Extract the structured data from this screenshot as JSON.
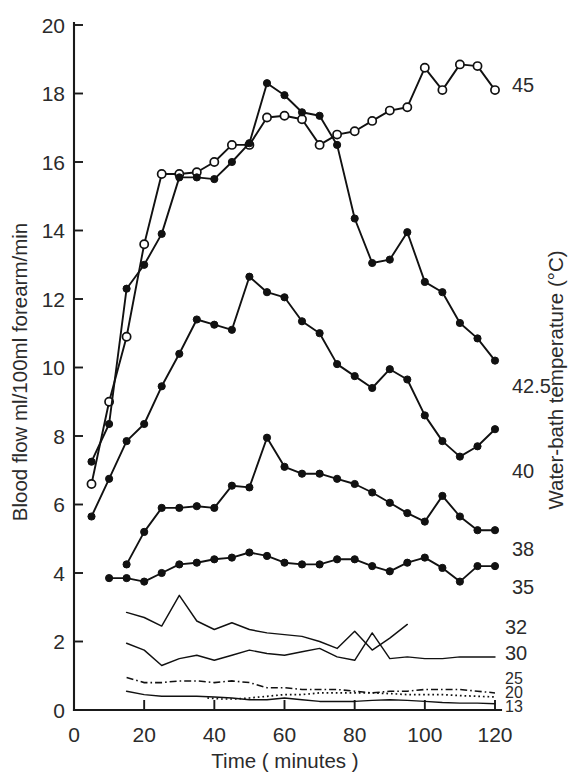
{
  "figure": {
    "kind": "scientific-line-chart",
    "background": "#ffffff",
    "ink_color": "#111111"
  },
  "chart_data": {
    "type": "line",
    "title": "",
    "xlabel": "Time ( minutes )",
    "ylabel": "Blood flow ml/100ml forearm/min",
    "y2label": "Water-bath temperature (°C)",
    "xlim": [
      0,
      123
    ],
    "ylim": [
      0,
      20
    ],
    "xticks": [
      0,
      20,
      40,
      60,
      80,
      100,
      120
    ],
    "xticklabels": [
      "0",
      "20",
      "40",
      "60",
      "80",
      "100",
      "120"
    ],
    "yticks": [
      0,
      2,
      4,
      6,
      8,
      10,
      12,
      14,
      16,
      18,
      20
    ],
    "yticklabels": [
      "0",
      "2",
      "4",
      "6",
      "8",
      "10",
      "12",
      "14",
      "16",
      "18",
      "20"
    ],
    "grid": false,
    "legend_position": "right-of-axes-inline-labels",
    "series": [
      {
        "name": "45",
        "label": "45",
        "marker": "open-circle",
        "linestyle": "solid",
        "x": [
          5,
          10,
          15,
          20,
          25,
          30,
          35,
          40,
          45,
          50,
          55,
          60,
          65,
          70,
          75,
          80,
          85,
          90,
          95,
          100,
          105,
          110,
          115,
          120
        ],
        "values": [
          6.6,
          9.0,
          10.9,
          13.6,
          15.65,
          15.65,
          15.7,
          16.0,
          16.5,
          16.5,
          17.3,
          17.35,
          17.25,
          16.5,
          16.8,
          16.9,
          17.2,
          17.5,
          17.6,
          18.75,
          18.1,
          18.85,
          18.8,
          18.1
        ]
      },
      {
        "name": "42.5",
        "label": "42.5",
        "marker": "filled-circle",
        "linestyle": "solid",
        "x": [
          5,
          10,
          15,
          20,
          25,
          30,
          35,
          40,
          45,
          50,
          55,
          60,
          65,
          70,
          75,
          80,
          85,
          90,
          95,
          100,
          105,
          110,
          115,
          120
        ],
        "values": [
          7.25,
          8.35,
          12.3,
          13.0,
          13.9,
          15.55,
          15.55,
          15.5,
          16.0,
          16.55,
          18.3,
          17.95,
          17.45,
          17.35,
          16.5,
          14.35,
          13.05,
          13.15,
          13.95,
          12.5,
          12.2,
          11.3,
          10.85,
          10.2
        ]
      },
      {
        "name": "40",
        "label": "40",
        "marker": "filled-circle",
        "linestyle": "solid",
        "x": [
          5,
          10,
          15,
          20,
          25,
          30,
          35,
          40,
          45,
          50,
          55,
          60,
          65,
          70,
          75,
          80,
          85,
          90,
          95,
          100,
          105,
          110,
          115,
          120
        ],
        "values": [
          5.65,
          6.75,
          7.85,
          8.35,
          9.45,
          10.4,
          11.4,
          11.25,
          11.1,
          12.65,
          12.2,
          12.05,
          11.35,
          11.0,
          10.1,
          9.75,
          9.4,
          9.95,
          9.65,
          8.6,
          7.85,
          7.4,
          7.7,
          8.2
        ]
      },
      {
        "name": "38",
        "label": "38",
        "marker": "filled-circle",
        "linestyle": "solid",
        "x": [
          15,
          20,
          25,
          30,
          35,
          40,
          45,
          50,
          55,
          60,
          65,
          70,
          75,
          80,
          85,
          90,
          95,
          100,
          105,
          110,
          115,
          120
        ],
        "values": [
          4.25,
          5.2,
          5.9,
          5.9,
          5.95,
          5.9,
          6.55,
          6.5,
          7.95,
          7.1,
          6.9,
          6.9,
          6.75,
          6.6,
          6.35,
          6.05,
          5.75,
          5.5,
          6.25,
          5.65,
          5.25,
          5.25
        ]
      },
      {
        "name": "35",
        "label": "35",
        "marker": "filled-circle",
        "linestyle": "solid",
        "x": [
          10,
          15,
          20,
          25,
          30,
          35,
          40,
          45,
          50,
          55,
          60,
          65,
          70,
          75,
          80,
          85,
          90,
          95,
          100,
          105,
          110,
          115,
          120
        ],
        "values": [
          3.85,
          3.85,
          3.75,
          4.0,
          4.25,
          4.3,
          4.4,
          4.45,
          4.6,
          4.5,
          4.3,
          4.25,
          4.25,
          4.4,
          4.4,
          4.2,
          4.05,
          4.3,
          4.45,
          4.15,
          3.75,
          4.2,
          4.2
        ]
      },
      {
        "name": "32",
        "label": "32",
        "marker": "none",
        "linestyle": "solid",
        "x": [
          15,
          20,
          25,
          30,
          35,
          40,
          45,
          50,
          55,
          60,
          65,
          70,
          75,
          80,
          85,
          90,
          95
        ],
        "values": [
          2.85,
          2.7,
          2.45,
          3.35,
          2.6,
          2.35,
          2.55,
          2.35,
          2.25,
          2.2,
          2.15,
          2.0,
          1.8,
          2.3,
          1.75,
          2.1,
          2.5
        ]
      },
      {
        "name": "30",
        "label": "30",
        "marker": "none",
        "linestyle": "solid",
        "x": [
          15,
          20,
          25,
          30,
          35,
          40,
          45,
          50,
          55,
          60,
          65,
          70,
          75,
          80,
          85,
          90,
          95,
          100,
          105,
          110,
          115,
          120
        ],
        "values": [
          1.95,
          1.75,
          1.3,
          1.5,
          1.6,
          1.45,
          1.6,
          1.75,
          1.65,
          1.6,
          1.7,
          1.8,
          1.55,
          1.45,
          2.25,
          1.5,
          1.55,
          1.5,
          1.5,
          1.55,
          1.55,
          1.55
        ]
      },
      {
        "name": "25",
        "label": "25",
        "marker": "none",
        "linestyle": "dash-dot",
        "x": [
          15,
          20,
          25,
          30,
          35,
          40,
          45,
          50,
          55,
          60,
          65,
          70,
          75,
          80,
          85,
          90,
          95,
          100,
          105,
          110,
          115,
          120
        ],
        "values": [
          0.95,
          0.8,
          0.8,
          0.85,
          0.85,
          0.8,
          0.85,
          0.8,
          0.65,
          0.65,
          0.6,
          0.6,
          0.6,
          0.55,
          0.5,
          0.55,
          0.55,
          0.6,
          0.6,
          0.6,
          0.55,
          0.5
        ]
      },
      {
        "name": "20",
        "label": "20",
        "marker": "none",
        "linestyle": "dotted",
        "x": [
          38,
          42,
          46,
          50,
          55,
          60,
          65,
          70,
          75,
          80,
          85,
          90,
          95,
          100,
          105,
          110,
          115,
          120
        ],
        "values": [
          0.35,
          0.32,
          0.32,
          0.35,
          0.4,
          0.45,
          0.45,
          0.5,
          0.5,
          0.5,
          0.5,
          0.48,
          0.45,
          0.45,
          0.45,
          0.42,
          0.4,
          0.38
        ]
      },
      {
        "name": "13",
        "label": "13",
        "marker": "none",
        "linestyle": "solid",
        "x": [
          15,
          20,
          25,
          30,
          35,
          40,
          45,
          50,
          55,
          60,
          65,
          70,
          75,
          80,
          85,
          90,
          95,
          100,
          105,
          110,
          115,
          120
        ],
        "values": [
          0.55,
          0.45,
          0.4,
          0.4,
          0.4,
          0.38,
          0.35,
          0.3,
          0.3,
          0.35,
          0.3,
          0.25,
          0.25,
          0.25,
          0.28,
          0.3,
          0.28,
          0.25,
          0.22,
          0.2,
          0.2,
          0.18
        ]
      }
    ]
  }
}
